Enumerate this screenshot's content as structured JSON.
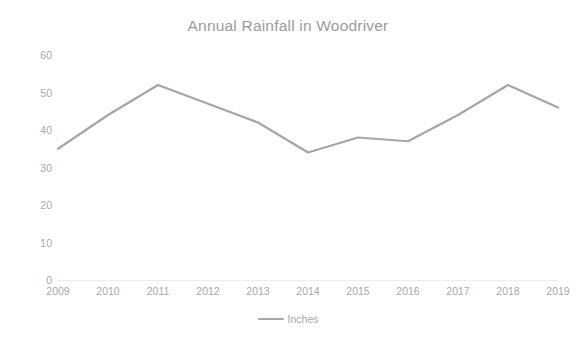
{
  "chart_data": {
    "type": "line",
    "title": "Annual Rainfall in Woodriver",
    "xlabel": "",
    "ylabel": "",
    "categories": [
      "2009",
      "2010",
      "2011",
      "2012",
      "2013",
      "2014",
      "2015",
      "2016",
      "2017",
      "2018",
      "2019"
    ],
    "series": [
      {
        "name": "Inches",
        "values": [
          35,
          44,
          52,
          47,
          42,
          34,
          38,
          37,
          44,
          52,
          46
        ],
        "color": "#a6a6a6"
      }
    ],
    "ylim": [
      0,
      60
    ],
    "yticks": [
      0,
      10,
      20,
      30,
      40,
      50,
      60
    ],
    "ytick_labels": [
      "0",
      "10",
      "20",
      "30",
      "40",
      "50",
      "60"
    ],
    "grid": false,
    "legend": {
      "position": "bottom",
      "entries": [
        {
          "label": "Inches",
          "marker": "line-swatch",
          "color": "#a6a6a6"
        }
      ]
    },
    "axis_line_color": "#ededed",
    "text_color": "#a8a8a8",
    "title_color": "#9c9c9c",
    "background": "#ffffff"
  }
}
